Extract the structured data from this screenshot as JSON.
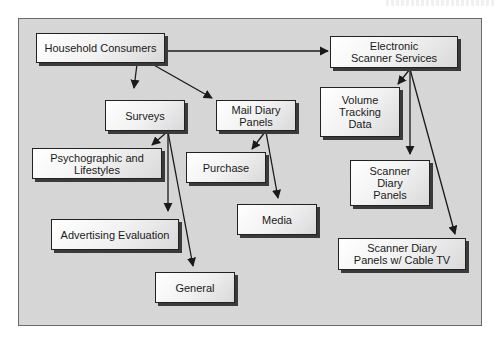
{
  "diagram": {
    "title_fragment": "",
    "colors": {
      "page_background": "#ffffff",
      "panel_background": "#d6d6d6",
      "panel_border": "#6a6a6a",
      "node_border": "#222222",
      "node_shadow": "#3a3a3a",
      "edge": "#1a1a1a"
    },
    "nodes": {
      "household_consumers": "Household Consumers",
      "electronic_scanner_services": "Electronic\nScanner Services",
      "surveys": "Surveys",
      "mail_diary_panels": "Mail Diary\nPanels",
      "volume_tracking_data": "Volume\nTracking\nData",
      "psychographic_lifestyles": "Psychographic and\nLifestyles",
      "purchase": "Purchase",
      "scanner_diary_panels": "Scanner\nDiary\nPanels",
      "media": "Media",
      "advertising_evaluation": "Advertising Evaluation",
      "scanner_diary_cable_tv": "Scanner Diary\nPanels w/ Cable TV",
      "general": "General"
    },
    "edges": [
      {
        "from": "Household Consumers",
        "to": "Electronic Scanner Services"
      },
      {
        "from": "Household Consumers",
        "to": "Surveys"
      },
      {
        "from": "Household Consumers",
        "to": "Mail Diary Panels"
      },
      {
        "from": "Surveys",
        "to": "Psychographic and Lifestyles"
      },
      {
        "from": "Surveys",
        "to": "Advertising Evaluation"
      },
      {
        "from": "Surveys",
        "to": "General"
      },
      {
        "from": "Mail Diary Panels",
        "to": "Purchase"
      },
      {
        "from": "Mail Diary Panels",
        "to": "Media"
      },
      {
        "from": "Electronic Scanner Services",
        "to": "Volume Tracking Data"
      },
      {
        "from": "Electronic Scanner Services",
        "to": "Scanner Diary Panels"
      },
      {
        "from": "Electronic Scanner Services",
        "to": "Scanner Diary Panels w/ Cable TV"
      }
    ]
  }
}
